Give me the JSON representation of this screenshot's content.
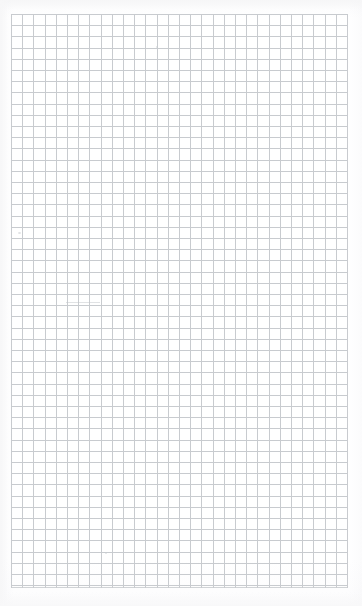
{
  "page": {
    "kind": "grid-paper",
    "width": 362,
    "height": 606,
    "background_color": "#ffffff",
    "paper_tint": "#fdfdfe",
    "caption": ""
  },
  "grid": {
    "label": "",
    "line_color": "#bfc3c7",
    "line_width_px": 1,
    "cell_size_px": 11.2,
    "columns": 30,
    "rows": 51,
    "origin_x_px": 11,
    "origin_y_px": 14,
    "width_px": 337,
    "height_px": 574,
    "has_major_lines": false,
    "major_every": 0,
    "major_line_color": "#bfc3c7"
  },
  "margins": {
    "left_px": 11,
    "top_px": 14,
    "right_px": 14,
    "bottom_px": 18,
    "color": "#ffffff"
  },
  "marks": [
    {
      "name": "speck-upper-left",
      "x": 18,
      "y": 232,
      "w": 3,
      "h": 2
    },
    {
      "name": "speck-lower-center",
      "x": 105,
      "y": 552,
      "w": 2,
      "h": 2
    },
    {
      "name": "speck-upper-center",
      "x": 156,
      "y": 46,
      "w": 2,
      "h": 2
    }
  ],
  "streaks": [
    {
      "name": "streak-mid-left",
      "x": 66,
      "y": 302,
      "w": 34,
      "h": 1
    }
  ]
}
